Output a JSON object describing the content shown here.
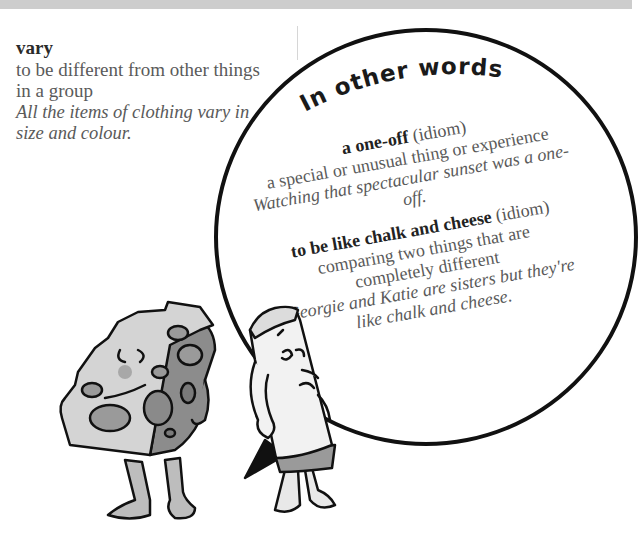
{
  "entry": {
    "headword": "vary",
    "definition": "to be different from other things in a group",
    "example": "All the items of clothing vary in size and colour."
  },
  "panel": {
    "title": "In other words",
    "idioms": [
      {
        "phrase": "a one-off",
        "tag": "(idiom)",
        "meaning_lines": [
          "a special or unusual thing or experience"
        ],
        "example_lines": [
          "Watching that spectacular sunset was a one-off."
        ]
      },
      {
        "phrase": "to be like chalk and cheese",
        "tag": "(idiom)",
        "meaning_lines": [
          "comparing two things that are",
          "completely different"
        ],
        "example_lines": [
          "Georgie and Katie are sisters but they're",
          "like chalk and cheese."
        ]
      }
    ]
  },
  "illustration": {
    "characters": [
      "cheese-character",
      "chalk-character"
    ],
    "colors": {
      "outline": "#111111",
      "cheese_face": "#d4d4d4",
      "cheese_side": "#8c8c8c",
      "holes": "#9a9a9a",
      "chalk": "#f2f2f2"
    }
  }
}
